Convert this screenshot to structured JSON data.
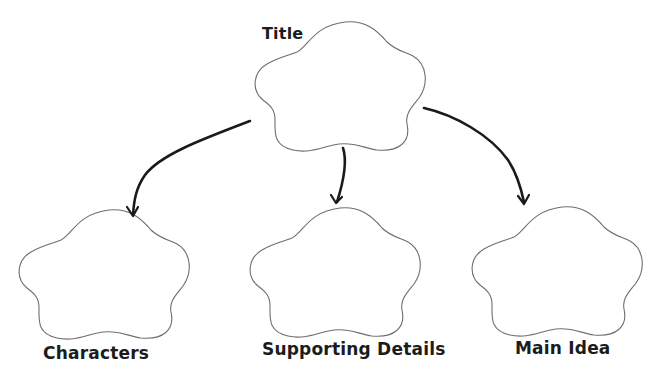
{
  "diagram": {
    "type": "cloud-graphic-organizer",
    "colors": {
      "background": "#ffffff",
      "cloud_stroke": "#6e6e6e",
      "arrow": "#1a1a1a",
      "label_text": "#1c1c1c"
    },
    "nodes": [
      {
        "id": "title",
        "label": "Title",
        "shape": "five-lobe-cloud",
        "bbox": [
          253,
          20,
          172,
          132
        ],
        "label_pos": [
          262,
          27
        ]
      },
      {
        "id": "characters",
        "label": "Characters",
        "shape": "five-lobe-cloud",
        "bbox": [
          17,
          208,
          175,
          132
        ],
        "label_pos": [
          43,
          345
        ]
      },
      {
        "id": "supporting_details",
        "label": "Supporting Details",
        "shape": "five-lobe-cloud",
        "bbox": [
          248,
          206,
          174,
          132
        ],
        "label_pos": [
          262,
          341
        ]
      },
      {
        "id": "main_idea",
        "label": "Main Idea",
        "shape": "five-lobe-cloud",
        "bbox": [
          470,
          205,
          173,
          131
        ],
        "label_pos": [
          515,
          340
        ]
      }
    ],
    "edges": [
      {
        "from": "title",
        "to": "characters",
        "style": "curved-arrow"
      },
      {
        "from": "title",
        "to": "supporting_details",
        "style": "curved-arrow"
      },
      {
        "from": "title",
        "to": "main_idea",
        "style": "curved-arrow"
      }
    ]
  }
}
